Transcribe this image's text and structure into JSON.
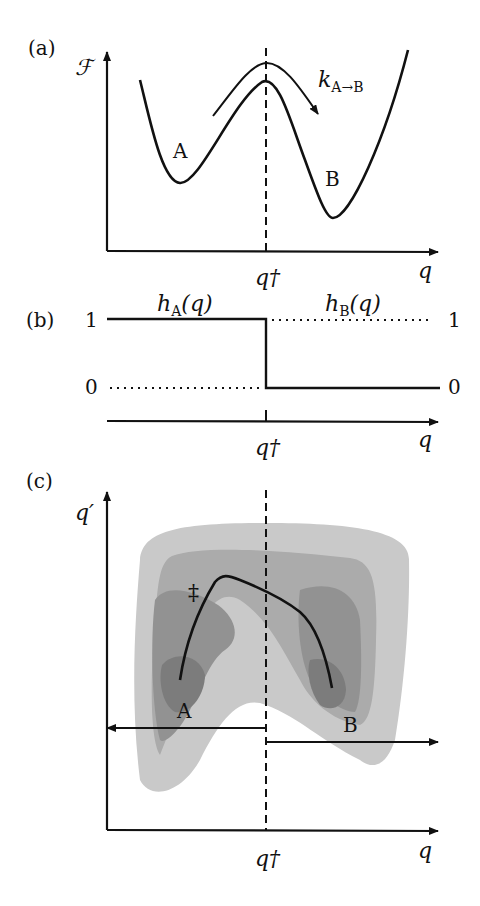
{
  "panels": {
    "a": {
      "label": "(a)",
      "y_axis_label": "ℱ",
      "x_axis_label": "q",
      "barrier_label": "q†",
      "state_a": "A",
      "state_b": "B",
      "rate_k": "k",
      "rate_sub": "A→B"
    },
    "b": {
      "label": "(b)",
      "hA": "h",
      "hA_sub": "A",
      "hA_arg": "(q)",
      "hB": "h",
      "hB_sub": "B",
      "hB_arg": "(q)",
      "left_one": "1",
      "left_zero": "0",
      "right_one": "1",
      "right_zero": "0",
      "x_axis_label": "q",
      "barrier_label": "q†"
    },
    "c": {
      "label": "(c)",
      "y_axis_label": "q′",
      "x_axis_label": "q",
      "barrier_label": "q†",
      "state_a": "A",
      "state_b": "B",
      "ts_marker": "‡"
    }
  },
  "colors": {
    "line": "#111111",
    "contour_1": "#c9c9c9",
    "contour_2": "#ababab",
    "contour_3": "#929292",
    "contour_4": "#7c7c7c"
  }
}
